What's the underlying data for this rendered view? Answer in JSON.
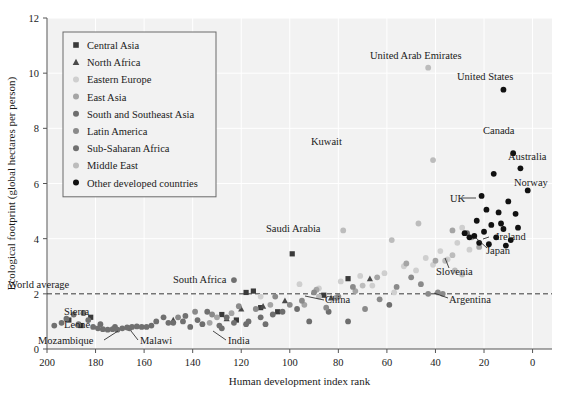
{
  "chart_data": {
    "type": "scatter",
    "title": "",
    "xlabel": "Human development index rank",
    "ylabel": "Ecological footprint (global hectares per person)",
    "xlim": [
      200,
      -8
    ],
    "ylim": [
      0,
      12
    ],
    "x_ticks": [
      200,
      180,
      160,
      140,
      120,
      100,
      80,
      60,
      40,
      20,
      0
    ],
    "y_ticks": [
      0,
      2,
      4,
      6,
      8,
      10,
      12
    ],
    "x_axis_reversed": true,
    "grid": "faint white gridlines on light gray panel",
    "legend_position": "upper-left inside panel",
    "reference_line": {
      "label": "World average",
      "value": 2.0,
      "style": "dashed",
      "orientation": "horizontal"
    },
    "series": [
      {
        "name": "Central Asia",
        "marker": "square",
        "color": "#3a3a3a",
        "points": [
          {
            "x": 191,
            "y": 1.05
          },
          {
            "x": 186,
            "y": 0.85
          },
          {
            "x": 182,
            "y": 1.15
          },
          {
            "x": 128,
            "y": 1.25
          },
          {
            "x": 122,
            "y": 1.05
          },
          {
            "x": 118,
            "y": 2.05
          },
          {
            "x": 115,
            "y": 2.1
          },
          {
            "x": 112,
            "y": 1.5
          },
          {
            "x": 105,
            "y": 1.35
          },
          {
            "x": 99,
            "y": 3.45
          },
          {
            "x": 86,
            "y": 1.95
          },
          {
            "x": 76,
            "y": 2.55
          }
        ]
      },
      {
        "name": "North Africa",
        "marker": "triangle",
        "color": "#4a4a4a",
        "points": [
          {
            "x": 148,
            "y": 1.05
          },
          {
            "x": 126,
            "y": 1.1
          },
          {
            "x": 120,
            "y": 1.45
          },
          {
            "x": 111,
            "y": 1.55
          },
          {
            "x": 102,
            "y": 1.75
          },
          {
            "x": 83,
            "y": 1.85
          },
          {
            "x": 67,
            "y": 2.55
          }
        ]
      },
      {
        "name": "Eastern Europe",
        "marker": "circle",
        "color": "#cfcfcf",
        "points": [
          {
            "x": 112,
            "y": 1.9
          },
          {
            "x": 96,
            "y": 2.35
          },
          {
            "x": 88,
            "y": 2.2
          },
          {
            "x": 79,
            "y": 2.45
          },
          {
            "x": 71,
            "y": 2.65
          },
          {
            "x": 66,
            "y": 2.3
          },
          {
            "x": 61,
            "y": 2.75
          },
          {
            "x": 57,
            "y": 2.05
          },
          {
            "x": 53,
            "y": 3.0
          },
          {
            "x": 48,
            "y": 2.85
          },
          {
            "x": 44,
            "y": 3.3
          },
          {
            "x": 41,
            "y": 3.05
          },
          {
            "x": 38,
            "y": 3.55
          },
          {
            "x": 35,
            "y": 3.25
          },
          {
            "x": 31,
            "y": 3.85
          },
          {
            "x": 29,
            "y": 4.4
          },
          {
            "x": 26,
            "y": 3.6
          }
        ]
      },
      {
        "name": "East Asia",
        "marker": "circle",
        "color": "#a5a5a5",
        "points": [
          {
            "x": 133,
            "y": 0.95
          },
          {
            "x": 130,
            "y": 1.15
          },
          {
            "x": 124,
            "y": 1.3
          },
          {
            "x": 108,
            "y": 1.6
          },
          {
            "x": 94,
            "y": 1.6
          },
          {
            "x": 89,
            "y": 2.15
          },
          {
            "x": 81,
            "y": 1.85
          },
          {
            "x": 73,
            "y": 2.1
          },
          {
            "x": 64,
            "y": 2.6
          },
          {
            "x": 52,
            "y": 3.1
          },
          {
            "x": 40,
            "y": 3.2
          },
          {
            "x": 33,
            "y": 4.3
          },
          {
            "x": 25,
            "y": 4.05
          },
          {
            "x": 22,
            "y": 3.7
          }
        ]
      },
      {
        "name": "South and Southeast Asia",
        "marker": "circle",
        "color": "#6e6e6e",
        "points": [
          {
            "x": 178,
            "y": 0.9
          },
          {
            "x": 172,
            "y": 0.8
          },
          {
            "x": 166,
            "y": 0.75
          },
          {
            "x": 157,
            "y": 0.85
          },
          {
            "x": 148,
            "y": 0.95
          },
          {
            "x": 141,
            "y": 0.8
          },
          {
            "x": 136,
            "y": 0.9
          },
          {
            "x": 128,
            "y": 0.75
          },
          {
            "x": 126,
            "y": 1.15
          },
          {
            "x": 118,
            "y": 0.9
          },
          {
            "x": 112,
            "y": 1.15
          },
          {
            "x": 107,
            "y": 1.25
          },
          {
            "x": 103,
            "y": 1.35
          },
          {
            "x": 97,
            "y": 1.45
          },
          {
            "x": 92,
            "y": 1.0
          },
          {
            "x": 84,
            "y": 1.35
          },
          {
            "x": 76,
            "y": 1.0
          },
          {
            "x": 59,
            "y": 1.6
          },
          {
            "x": 27,
            "y": 4.2
          }
        ]
      },
      {
        "name": "Latin America",
        "marker": "circle",
        "color": "#8a8a8a",
        "points": [
          {
            "x": 146,
            "y": 1.15
          },
          {
            "x": 139,
            "y": 1.35
          },
          {
            "x": 132,
            "y": 1.25
          },
          {
            "x": 121,
            "y": 1.55
          },
          {
            "x": 114,
            "y": 1.45
          },
          {
            "x": 106,
            "y": 1.9
          },
          {
            "x": 100,
            "y": 1.6
          },
          {
            "x": 95,
            "y": 1.75
          },
          {
            "x": 90,
            "y": 2.05
          },
          {
            "x": 85,
            "y": 1.5
          },
          {
            "x": 80,
            "y": 1.9
          },
          {
            "x": 74,
            "y": 2.25
          },
          {
            "x": 69,
            "y": 1.45
          },
          {
            "x": 63,
            "y": 1.8
          },
          {
            "x": 56,
            "y": 2.25
          },
          {
            "x": 50,
            "y": 2.6
          },
          {
            "x": 46,
            "y": 2.35
          },
          {
            "x": 43,
            "y": 2.0
          },
          {
            "x": 39,
            "y": 2.05
          },
          {
            "x": 37,
            "y": 2.0
          }
        ]
      },
      {
        "name": "Sub-Saharan Africa",
        "marker": "circle",
        "color": "#707070",
        "points": [
          {
            "x": 197,
            "y": 0.85
          },
          {
            "x": 194,
            "y": 0.95
          },
          {
            "x": 192,
            "y": 1.1
          },
          {
            "x": 189,
            "y": 1.25
          },
          {
            "x": 187,
            "y": 0.9
          },
          {
            "x": 185,
            "y": 1.3
          },
          {
            "x": 183,
            "y": 1.05
          },
          {
            "x": 181,
            "y": 0.8
          },
          {
            "x": 179,
            "y": 0.75
          },
          {
            "x": 177,
            "y": 0.72
          },
          {
            "x": 175,
            "y": 0.7
          },
          {
            "x": 173,
            "y": 0.72
          },
          {
            "x": 171,
            "y": 0.7
          },
          {
            "x": 169,
            "y": 0.75
          },
          {
            "x": 167,
            "y": 0.78
          },
          {
            "x": 165,
            "y": 0.8
          },
          {
            "x": 163,
            "y": 0.82
          },
          {
            "x": 161,
            "y": 0.8
          },
          {
            "x": 159,
            "y": 0.8
          },
          {
            "x": 155,
            "y": 1.0
          },
          {
            "x": 152,
            "y": 1.15
          },
          {
            "x": 150,
            "y": 0.95
          },
          {
            "x": 144,
            "y": 1.0
          },
          {
            "x": 143,
            "y": 1.2
          },
          {
            "x": 138,
            "y": 1.05
          },
          {
            "x": 134,
            "y": 1.35
          },
          {
            "x": 129,
            "y": 0.85
          },
          {
            "x": 123,
            "y": 0.95
          },
          {
            "x": 117,
            "y": 1.0
          },
          {
            "x": 110,
            "y": 0.9
          },
          {
            "x": 123,
            "y": 2.5
          }
        ]
      },
      {
        "name": "Middle East",
        "marker": "circle",
        "color": "#bcbcbc",
        "points": [
          {
            "x": 43,
            "y": 10.2
          },
          {
            "x": 41,
            "y": 6.85
          },
          {
            "x": 78,
            "y": 4.3
          },
          {
            "x": 58,
            "y": 3.95
          },
          {
            "x": 47,
            "y": 4.55
          },
          {
            "x": 36,
            "y": 3.2
          },
          {
            "x": 32,
            "y": 2.85
          },
          {
            "x": 29,
            "y": 2.7
          },
          {
            "x": 88,
            "y": 1.9
          },
          {
            "x": 70,
            "y": 2.3
          },
          {
            "x": 33,
            "y": 3.4
          }
        ]
      },
      {
        "name": "Other developed countries",
        "marker": "circle",
        "color": "#111111",
        "points": [
          {
            "x": 12,
            "y": 9.4
          },
          {
            "x": 8,
            "y": 7.1
          },
          {
            "x": 5,
            "y": 6.55
          },
          {
            "x": 16,
            "y": 6.35
          },
          {
            "x": 2,
            "y": 5.75
          },
          {
            "x": 21,
            "y": 5.55
          },
          {
            "x": 10,
            "y": 5.35
          },
          {
            "x": 19,
            "y": 5.05
          },
          {
            "x": 14,
            "y": 4.95
          },
          {
            "x": 7,
            "y": 4.9
          },
          {
            "x": 23,
            "y": 4.65
          },
          {
            "x": 17,
            "y": 4.5
          },
          {
            "x": 12,
            "y": 4.35
          },
          {
            "x": 20,
            "y": 4.25
          },
          {
            "x": 24,
            "y": 4.1
          },
          {
            "x": 15,
            "y": 4.05
          },
          {
            "x": 9,
            "y": 3.95
          },
          {
            "x": 26,
            "y": 4.05
          },
          {
            "x": 18,
            "y": 3.8
          },
          {
            "x": 11,
            "y": 3.75
          },
          {
            "x": 6,
            "y": 4.4
          },
          {
            "x": 22,
            "y": 3.85
          },
          {
            "x": 13,
            "y": 4.55
          },
          {
            "x": 28,
            "y": 4.2
          }
        ]
      }
    ],
    "annotations": [
      {
        "label": "United Arab Emirates",
        "tx": 370,
        "ty": 59,
        "anchor": "start",
        "leader": null
      },
      {
        "label": "United States",
        "tx": 457,
        "ty": 80,
        "anchor": "start",
        "leader": null
      },
      {
        "label": "Kuwait",
        "tx": 311,
        "ty": 145,
        "anchor": "start",
        "leader": null
      },
      {
        "label": "Canada",
        "tx": 483,
        "ty": 134,
        "anchor": "start",
        "leader": null
      },
      {
        "label": "Australia",
        "tx": 508,
        "ty": 160,
        "anchor": "start",
        "leader": null
      },
      {
        "label": "Norway",
        "tx": 514,
        "ty": 186,
        "anchor": "start",
        "leader": null
      },
      {
        "label": "UK",
        "tx": 450,
        "ty": 202,
        "anchor": "start",
        "leader": "462,198 476,198"
      },
      {
        "label": "Ireland",
        "tx": 496,
        "ty": 240,
        "anchor": "start",
        "leader": "489,237 483,239"
      },
      {
        "label": "Japan",
        "tx": 486,
        "ty": 254,
        "anchor": "start",
        "leader": "487,248 476,238"
      },
      {
        "label": "Slovenia",
        "tx": 436,
        "ty": 275,
        "anchor": "start",
        "leader": "449,268 445,258"
      },
      {
        "label": "Argentina",
        "tx": 449,
        "ty": 303,
        "anchor": "start",
        "leader": "448,298 434,293"
      },
      {
        "label": "Saudi Arabia",
        "tx": 266,
        "ty": 232,
        "anchor": "start",
        "leader": null
      },
      {
        "label": "South Africa",
        "tx": 173,
        "ty": 283,
        "anchor": "start",
        "leader": null
      },
      {
        "label": "China",
        "tx": 325,
        "ty": 303,
        "anchor": "start",
        "leader": "324,300 305,296"
      },
      {
        "label": "World average",
        "tx": 8,
        "ty": 288,
        "anchor": "start",
        "leader": null
      },
      {
        "label": "Sierra",
        "tx": 64,
        "ty": 315,
        "anchor": "start",
        "leader": null
      },
      {
        "label": "Leone",
        "tx": 64,
        "ty": 328,
        "anchor": "start",
        "leader": null
      },
      {
        "label": "Mozambique",
        "tx": 38,
        "ty": 344,
        "anchor": "start",
        "leader": "104,340 118,331"
      },
      {
        "label": "Malawi",
        "tx": 140,
        "ty": 344,
        "anchor": "start",
        "leader": "138,340 131,331"
      },
      {
        "label": "India",
        "tx": 228,
        "ty": 344,
        "anchor": "start",
        "leader": "226,340 213,331"
      }
    ]
  },
  "legend": {
    "items": [
      {
        "label": "Central Asia",
        "marker": "square",
        "color": "#3a3a3a"
      },
      {
        "label": "North Africa",
        "marker": "triangle",
        "color": "#4a4a4a"
      },
      {
        "label": "Eastern Europe",
        "marker": "circle",
        "color": "#cfcfcf"
      },
      {
        "label": "East Asia",
        "marker": "circle",
        "color": "#a5a5a5"
      },
      {
        "label": "South and Southeast Asia",
        "marker": "circle",
        "color": "#6e6e6e"
      },
      {
        "label": "Latin America",
        "marker": "circle",
        "color": "#8a8a8a"
      },
      {
        "label": "Sub-Saharan Africa",
        "marker": "circle",
        "color": "#707070"
      },
      {
        "label": "Middle East",
        "marker": "circle",
        "color": "#bcbcbc"
      },
      {
        "label": "Other developed countries",
        "marker": "circle",
        "color": "#111111"
      }
    ]
  },
  "axes": {
    "x_label": "Human development index rank",
    "y_label": "Ecological footprint (global hectares per person)",
    "x_tick_labels": [
      "200",
      "180",
      "160",
      "140",
      "120",
      "100",
      "80",
      "60",
      "40",
      "20",
      "0"
    ],
    "y_tick_labels": [
      "0",
      "2",
      "4",
      "6",
      "8",
      "10",
      "12"
    ]
  },
  "style": {
    "panel_bg": "#f2f2f2",
    "grid_color": "#ffffff",
    "axis_color": "#555555",
    "text_color": "#1a1a1a"
  }
}
